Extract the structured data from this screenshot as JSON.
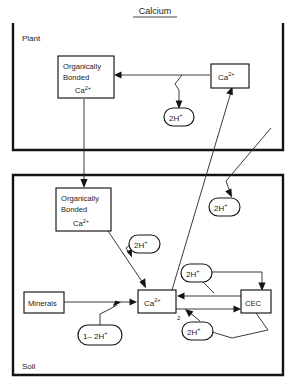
{
  "diagram": {
    "title": "Calcium",
    "type": "nutrient-cycle-flowchart",
    "compartments": [
      {
        "id": "plant",
        "label": "Plant"
      },
      {
        "id": "soil",
        "label": "Soil"
      }
    ],
    "nodes": {
      "plant_organic": {
        "line1": "Organically",
        "line2": "Bonded",
        "line3": "Ca",
        "line3_sup": "2+",
        "shape": "rect",
        "compartment": "plant"
      },
      "plant_ca": {
        "label": "Ca",
        "sup": "2+",
        "shape": "rect",
        "compartment": "plant"
      },
      "plant_h": {
        "label": "2H",
        "sup": "+",
        "shape": "ellipse",
        "compartment": "plant"
      },
      "soil_organic": {
        "line1": "Organically",
        "line2": "Bonded",
        "line3": "Ca",
        "line3_sup": "2+",
        "shape": "rect",
        "compartment": "soil"
      },
      "soil_ca": {
        "label": "Ca",
        "sup": "2+",
        "sub": "2",
        "shape": "rect",
        "compartment": "soil"
      },
      "minerals": {
        "label": "Minerals",
        "shape": "rect",
        "compartment": "soil"
      },
      "cec": {
        "label": "CEC",
        "shape": "rect",
        "compartment": "soil"
      },
      "soil_h_upper_right": {
        "label": "2H",
        "sup": "+",
        "shape": "ellipse",
        "compartment": "soil"
      },
      "soil_h_organic": {
        "label": "2H",
        "sup": "+",
        "shape": "ellipse",
        "compartment": "soil"
      },
      "soil_h_cec_in": {
        "label": "2H",
        "sup": "+",
        "shape": "ellipse",
        "compartment": "soil"
      },
      "soil_h_cec_out": {
        "label": "2H",
        "sup": "+",
        "shape": "ellipse",
        "compartment": "soil"
      },
      "mineral_h": {
        "label": "1– 2H",
        "sup": "+",
        "shape": "ellipse",
        "compartment": "soil"
      }
    },
    "colors": {
      "frame": "#141414",
      "node_stroke": "#141414",
      "flow": "#303030",
      "background": "#ffffff",
      "text": "#1a1a1a"
    }
  }
}
